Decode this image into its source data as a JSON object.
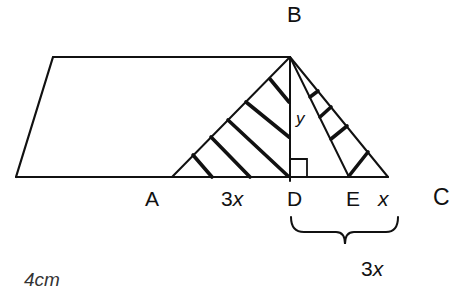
{
  "diagram": {
    "type": "geometry",
    "labels": {
      "B": "B",
      "A": "A",
      "D": "D",
      "E": "E",
      "C": "C",
      "AD": "3x",
      "EC": "x",
      "DC_brace": "3x",
      "height": "y"
    },
    "partial_text": "4cm",
    "points": {
      "parallelogram_top_left": [
        53,
        57
      ],
      "parallelogram_top_right_B": [
        290,
        57
      ],
      "parallelogram_bottom_left": [
        16,
        177
      ],
      "A": [
        172,
        177
      ],
      "D": [
        290,
        177
      ],
      "E": [
        349,
        177
      ],
      "C_end": [
        388,
        177
      ]
    },
    "colors": {
      "stroke": "#111111",
      "background": "#ffffff"
    }
  }
}
